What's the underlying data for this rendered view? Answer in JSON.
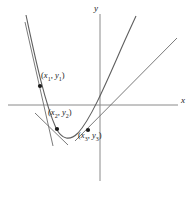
{
  "figure": {
    "name": "parabola-with-tangent-lines",
    "background_color": "#ffffff",
    "width": 195,
    "height": 203
  },
  "axes": {
    "x_label": "x",
    "y_label": "y",
    "x_axis": {
      "x1": 8,
      "y1": 105,
      "x2": 178,
      "y2": 105
    },
    "y_axis": {
      "x1": 100,
      "y1": 14,
      "x2": 100,
      "y2": 181
    },
    "color": "#8a8a8a"
  },
  "points": [
    {
      "id": "p1",
      "label": "(x1, y1)",
      "var_x": "x",
      "sub_x": "1",
      "var_y": "y",
      "sub_y": "1",
      "cx": 40,
      "cy": 86,
      "r": 2.1
    },
    {
      "id": "p2",
      "label": "(x2, y2)",
      "var_x": "x",
      "sub_x": "2",
      "var_y": "y",
      "sub_y": "2",
      "cx": 57,
      "cy": 129,
      "r": 2.1
    },
    {
      "id": "p3",
      "label": "(x3, y3)",
      "var_x": "x",
      "sub_x": "3",
      "var_y": "y",
      "sub_y": "3",
      "cx": 88,
      "cy": 130,
      "r": 2.1
    }
  ],
  "curve": {
    "name": "parabola",
    "color": "#5f5f5f",
    "path": "M 26 15 C 34 52, 44 101, 56 128 C 62 140, 70 141, 78 133 C 90 120, 104 88, 118 56 C 124 42, 130 29, 136 16",
    "vertex": {
      "x": 64,
      "y": 136
    }
  },
  "tangents": [
    {
      "id": "t1",
      "name": "tangent-at-p1",
      "color": "#6b6b6b",
      "x1": 25,
      "y1": 22,
      "x2": 53,
      "y2": 146
    },
    {
      "id": "t2",
      "name": "tangent-at-p2",
      "color": "#6b6b6b",
      "x1": 35,
      "y1": 113,
      "x2": 68,
      "y2": 145
    },
    {
      "id": "t3",
      "name": "tangent-at-p3",
      "color": "#6b6b6b",
      "x1": 75,
      "y1": 141,
      "x2": 177,
      "y2": 38
    }
  ],
  "chart_data": {
    "type": "line",
    "title": "",
    "xlabel": "x",
    "ylabel": "y",
    "grid": false,
    "legend": "none",
    "series": [
      {
        "name": "parabola",
        "points": [
          {
            "label": "(x1, y1)",
            "x": -6.0,
            "y": 1.9
          },
          {
            "label": "(x2, y2)",
            "x": -4.3,
            "y": -2.4
          },
          {
            "label": "(x3, y3)",
            "x": -1.2,
            "y": -2.5
          }
        ]
      }
    ],
    "annotations": [
      "(x1, y1)",
      "(x2, y2)",
      "(x3, y3)"
    ]
  }
}
